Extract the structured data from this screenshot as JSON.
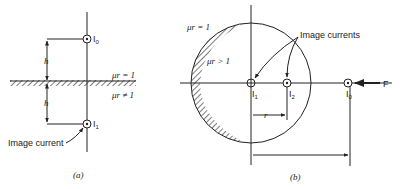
{
  "panel_a": {
    "caption": "(a)",
    "top_current": {
      "symbol": "I",
      "subscript": "0"
    },
    "image_current": {
      "symbol": "I",
      "subscript": "1"
    },
    "distance_label_upper": "h",
    "distance_label_lower": "h",
    "medium_upper": "μr = 1",
    "medium_lower": "μr ≠ 1",
    "annotation": "Image current"
  },
  "panel_b": {
    "caption": "(b)",
    "outer_medium": "μr = 1",
    "inner_medium": "μr > 1",
    "annotation": "Image currents",
    "currents": [
      {
        "symbol": "I",
        "subscript": "1"
      },
      {
        "symbol": "I",
        "subscript": "2"
      },
      {
        "symbol": "I",
        "subscript": "0"
      }
    ],
    "radius_label": "r",
    "force_label": "F"
  }
}
